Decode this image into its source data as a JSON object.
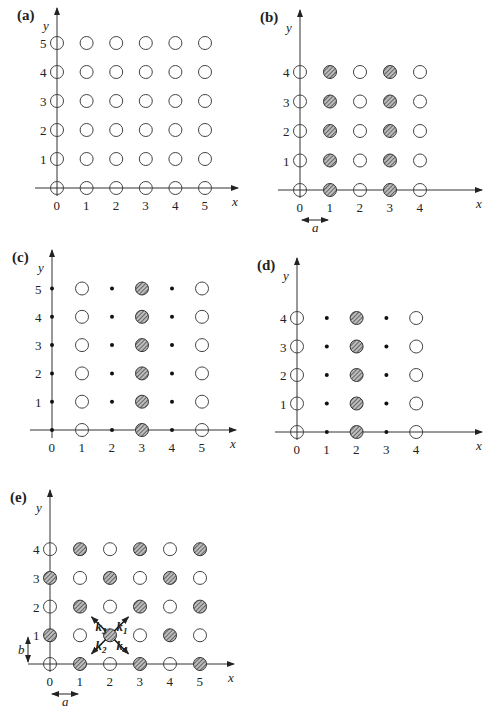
{
  "figure": {
    "panels": [
      {
        "id": "a",
        "label": "(a)",
        "origin": [
          57,
          188
        ],
        "dx": 29.6,
        "dy": 29,
        "xticks": [
          "0",
          "1",
          "2",
          "3",
          "4",
          "5"
        ],
        "yticks": [
          "1",
          "2",
          "3",
          "4",
          "5"
        ],
        "x_axis_end": 238,
        "y_axis_top": 8,
        "xlabel": "x",
        "ylabel": "y",
        "grid": [
          "OOOOOO",
          "OOOOOO",
          "OOOOOO",
          "OOOOOO",
          "OOOOOO",
          "OOOOOO"
        ]
      },
      {
        "id": "b",
        "label": "(b)",
        "origin": [
          300,
          190
        ],
        "dx": 30,
        "dy": 29.5,
        "xticks": [
          "0",
          "1",
          "2",
          "3",
          "4"
        ],
        "yticks": [
          "1",
          "2",
          "3",
          "4"
        ],
        "x_axis_end": 482,
        "y_axis_top": 10,
        "xlabel": "x",
        "ylabel": "y",
        "spacing_label": "a",
        "grid": [
          "OHOHO",
          "OHOHO",
          "OHOHO",
          "OHOHO",
          "OHOHO"
        ]
      },
      {
        "id": "c",
        "label": "(c)",
        "origin": [
          52,
          430
        ],
        "dx": 30,
        "dy": 28.3,
        "xticks": [
          "0",
          "1",
          "2",
          "3",
          "4",
          "5"
        ],
        "yticks": [
          "1",
          "2",
          "3",
          "4",
          "5"
        ],
        "x_axis_end": 236,
        "y_axis_top": 250,
        "xlabel": "x",
        "ylabel": "y",
        "grid": [
          ".O.H.O",
          ".O.H.O",
          ".O.H.O",
          ".O.H.O",
          ".O.H.O",
          ".O.H.O"
        ]
      },
      {
        "id": "d",
        "label": "(d)",
        "origin": [
          297,
          432
        ],
        "dx": 29.8,
        "dy": 28.5,
        "xticks": [
          "0",
          "1",
          "2",
          "3",
          "4"
        ],
        "yticks": [
          "1",
          "2",
          "3",
          "4"
        ],
        "x_axis_end": 482,
        "y_axis_top": 258,
        "xlabel": "x",
        "ylabel": "y",
        "grid": [
          "O.H.O",
          "O.H.O",
          "O.H.O",
          "O.H.O",
          "O.H.O"
        ]
      },
      {
        "id": "e",
        "label": "(e)",
        "origin": [
          50,
          664
        ],
        "dx": 30,
        "dy": 28.7,
        "xticks": [
          "0",
          "1",
          "2",
          "3",
          "4",
          "5"
        ],
        "yticks": [
          "1",
          "2",
          "3",
          "4"
        ],
        "x_axis_end": 234,
        "y_axis_top": 490,
        "xlabel": "x",
        "ylabel": "y",
        "spacing_label_x": "a",
        "spacing_label_y": "b",
        "vectors": [
          {
            "name": "k",
            "sub": "1",
            "dir": [
              1,
              -1
            ]
          },
          {
            "name": "k",
            "sub": "2",
            "dir": [
              -1,
              1
            ]
          },
          {
            "name": "k",
            "sub": "3",
            "dir": [
              -1,
              -1
            ]
          },
          {
            "name": "k",
            "sub": "4",
            "dir": [
              1,
              1
            ]
          }
        ],
        "vector_center": [
          2,
          1
        ],
        "grid": [
          "OHOHOH",
          "HOHOHO",
          "OHOHOH",
          "HOHOHO",
          "OHOHOH"
        ]
      }
    ],
    "legend": {
      "O": "open circle (lattice site)",
      "H": "hatched circle",
      ".": "small dot"
    }
  }
}
